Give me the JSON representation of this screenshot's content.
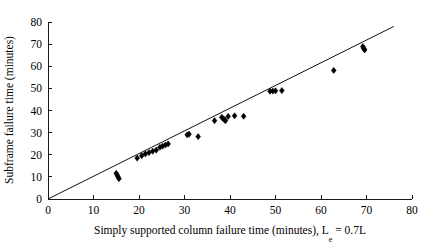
{
  "chart_data": {
    "type": "scatter",
    "title": "",
    "xlabel": "Simply supported column failure time (minutes), L",
    "xlabel_sub": "e",
    "xlabel_tail": " = 0.7L",
    "ylabel": "Subframe failure time (minutes)",
    "xlim": [
      0,
      80
    ],
    "ylim": [
      0,
      80
    ],
    "xticks": [
      0,
      10,
      20,
      30,
      40,
      50,
      60,
      70,
      80
    ],
    "yticks": [
      0,
      10,
      20,
      30,
      40,
      50,
      60,
      70,
      80
    ],
    "grid": false,
    "legend": null,
    "marker": "diamond",
    "marker_color": "#000000",
    "reference_line": {
      "label": "equality line",
      "x": [
        0,
        76
      ],
      "y": [
        0,
        78
      ],
      "color": "#111111"
    },
    "points": [
      {
        "x": 15.0,
        "y": 11.6
      },
      {
        "x": 15.2,
        "y": 10.8
      },
      {
        "x": 15.4,
        "y": 10.0
      },
      {
        "x": 15.6,
        "y": 9.2
      },
      {
        "x": 19.6,
        "y": 18.5
      },
      {
        "x": 20.6,
        "y": 19.6
      },
      {
        "x": 21.4,
        "y": 20.4
      },
      {
        "x": 22.2,
        "y": 21.0
      },
      {
        "x": 23.0,
        "y": 21.6
      },
      {
        "x": 23.8,
        "y": 22.1
      },
      {
        "x": 24.6,
        "y": 23.4
      },
      {
        "x": 25.2,
        "y": 23.9
      },
      {
        "x": 25.8,
        "y": 24.4
      },
      {
        "x": 26.4,
        "y": 24.9
      },
      {
        "x": 30.6,
        "y": 29.0
      },
      {
        "x": 31.0,
        "y": 29.3
      },
      {
        "x": 33.0,
        "y": 28.2
      },
      {
        "x": 36.6,
        "y": 35.4
      },
      {
        "x": 38.2,
        "y": 36.9
      },
      {
        "x": 38.6,
        "y": 36.2
      },
      {
        "x": 38.8,
        "y": 35.7
      },
      {
        "x": 39.0,
        "y": 35.4
      },
      {
        "x": 39.6,
        "y": 37.3
      },
      {
        "x": 41.0,
        "y": 37.6
      },
      {
        "x": 43.0,
        "y": 37.4
      },
      {
        "x": 48.8,
        "y": 48.7
      },
      {
        "x": 49.4,
        "y": 48.8
      },
      {
        "x": 50.0,
        "y": 48.9
      },
      {
        "x": 51.4,
        "y": 49.0
      },
      {
        "x": 62.8,
        "y": 58.1
      },
      {
        "x": 69.2,
        "y": 68.9
      },
      {
        "x": 69.4,
        "y": 68.0
      },
      {
        "x": 69.6,
        "y": 67.4
      }
    ]
  }
}
